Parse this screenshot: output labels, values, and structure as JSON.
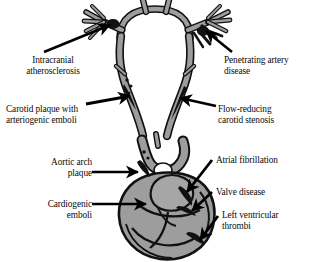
{
  "figure": {
    "background_color": "#ffffff",
    "vessel_fill": "#9d9d9d",
    "vessel_stroke": "#111111",
    "heart_fill": "#9d9d9d",
    "lesion_color": "#111111",
    "arrow_color": "#000000",
    "text_color": "#0b0b0b"
  },
  "labels": [
    {
      "id": "intracranial-atherosclerosis",
      "line1": "Intracranial",
      "line2": "atherosclerosis",
      "align": "center",
      "x": 10,
      "y": 55,
      "width": 86
    },
    {
      "id": "penetrating-artery-disease",
      "line1": "Penetrating artery",
      "line2": "disease",
      "align": "left",
      "x": 224,
      "y": 55,
      "width": 86
    },
    {
      "id": "carotid-plaque-arteriogenic-emboli",
      "line1": "Carotid plaque with",
      "line2": "arteriogenic emboli",
      "align": "left",
      "x": 6,
      "y": 104,
      "width": 96
    },
    {
      "id": "flow-reducing-carotid-stenosis",
      "line1": "Flow-reducing",
      "line2": "carotid stenosis",
      "align": "left",
      "x": 218,
      "y": 104,
      "width": 90
    },
    {
      "id": "aortic-arch-plaque",
      "line1": "Aortic arch",
      "line2": "plaque",
      "align": "right",
      "x": 24,
      "y": 157,
      "width": 68
    },
    {
      "id": "atrial-fibrillation",
      "line1": "Atrial fibrillation",
      "line2": "",
      "align": "left",
      "x": 216,
      "y": 155,
      "width": 90
    },
    {
      "id": "valve-disease",
      "line1": "Valve disease",
      "line2": "",
      "align": "left",
      "x": 216,
      "y": 187,
      "width": 86
    },
    {
      "id": "cardiogenic-emboli",
      "line1": "Cardiogenic",
      "line2": "emboli",
      "align": "right",
      "x": 24,
      "y": 199,
      "width": 68
    },
    {
      "id": "left-ventricular-thrombi",
      "line1": "Left ventricular",
      "line2": "thrombi",
      "align": "left",
      "x": 222,
      "y": 210,
      "width": 86
    }
  ],
  "anatomy_parts": [
    "circle-of-willis",
    "middle-cerebral-artery-branches",
    "penetrating-arteries",
    "left-internal-carotid-artery",
    "right-internal-carotid-artery",
    "carotid-bifurcation",
    "aortic-arch",
    "heart"
  ],
  "lesion_sites": [
    "intracranial-atherosclerosis-site",
    "penetrating-artery-site",
    "carotid-plaque-site",
    "carotid-stenosis-site",
    "aortic-arch-plaque-site",
    "left-atrium-site",
    "mitral-valve-site",
    "left-ventricle-site"
  ]
}
